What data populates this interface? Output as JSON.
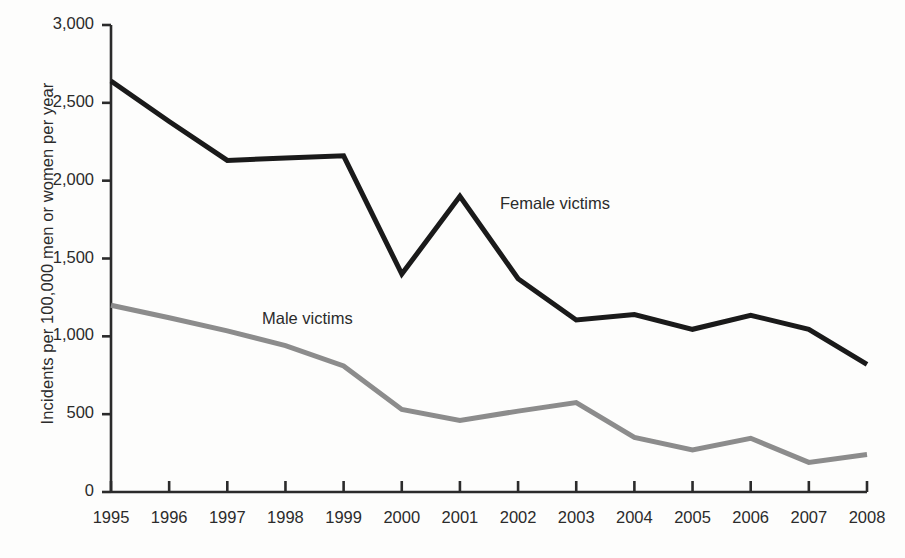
{
  "chart_data": {
    "type": "line",
    "title": "",
    "xlabel": "",
    "ylabel": "Incidents per 100,000 men or women per year",
    "x": [
      1995,
      1996,
      1997,
      1998,
      1999,
      2000,
      2001,
      2002,
      2003,
      2004,
      2005,
      2006,
      2007,
      2008
    ],
    "categories": [
      "1995",
      "1996",
      "1997",
      "1998",
      "1999",
      "2000",
      "2001",
      "2002",
      "2003",
      "2004",
      "2005",
      "2006",
      "2007",
      "2008"
    ],
    "xlim": [
      1995,
      2008
    ],
    "ylim": [
      0,
      3000
    ],
    "yticks": [
      0,
      500,
      1000,
      1500,
      2000,
      2500,
      3000
    ],
    "ytick_labels": [
      "0",
      "500",
      "1,000",
      "1,500",
      "2,000",
      "2,500",
      "3,000"
    ],
    "grid": false,
    "legend_position": "inline-annotation",
    "series": [
      {
        "name": "Female victims",
        "color": "#1a1a1a",
        "line_width": 5,
        "values": [
          2640,
          2380,
          2130,
          2145,
          2160,
          1400,
          1900,
          1370,
          1105,
          1140,
          1045,
          1135,
          1045,
          820
        ]
      },
      {
        "name": "Male victims",
        "color": "#8c8c8c",
        "line_width": 5,
        "values": [
          1200,
          1120,
          1035,
          940,
          810,
          530,
          460,
          520,
          575,
          350,
          270,
          345,
          190,
          240
        ]
      }
    ],
    "annotations": [
      {
        "text": "Female victims",
        "x": 2001.9,
        "y": 1830
      },
      {
        "text": "Male victims",
        "x": 1997.6,
        "y": 1090
      }
    ]
  },
  "axis": {
    "y_title": "Incidents per 100,000 men or women per year"
  }
}
